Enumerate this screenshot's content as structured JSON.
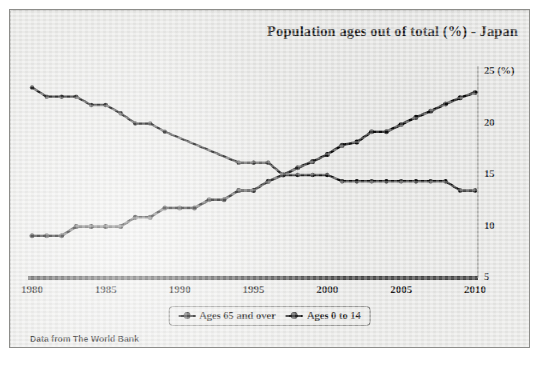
{
  "title": "Population ages out of total (%) - Japan",
  "source_note": "Data from The World Bank",
  "legend": {
    "items": [
      {
        "label": "Ages 65 and over"
      },
      {
        "label": "Ages 0 to 14"
      }
    ]
  },
  "axis": {
    "y_unit_label": "25 (%)",
    "y_ticks": [
      "25 (%)",
      "20",
      "15",
      "10",
      "5"
    ],
    "x_ticks": [
      "1980",
      "1985",
      "1990",
      "1995",
      "2000",
      "2005",
      "2010"
    ]
  },
  "colors": {
    "line": "#0d0d0d",
    "panel_background": "#e8e8e6",
    "panel_border": "#8d8d8a",
    "text": "#161616"
  },
  "chart_data": {
    "type": "line",
    "title": "Population ages out of total (%) - Japan",
    "subtitle": "",
    "xlabel": "",
    "ylabel": "(%)",
    "xlim": [
      1980,
      2010
    ],
    "ylim": [
      5,
      25
    ],
    "y_ticks": [
      5,
      10,
      15,
      20,
      25
    ],
    "x_ticks": [
      1980,
      1985,
      1990,
      1995,
      2000,
      2005,
      2010
    ],
    "grid": false,
    "legend_position": "bottom-center",
    "annotations": [
      "Data from The World Bank"
    ],
    "series": [
      {
        "name": "Ages 65 and over",
        "x": [
          1980,
          1981,
          1982,
          1983,
          1984,
          1985,
          1986,
          1987,
          1988,
          1989,
          1990,
          1991,
          1992,
          1993,
          1994,
          1995,
          1996,
          1997,
          1998,
          1999,
          2000,
          2001,
          2002,
          2003,
          2004,
          2005,
          2006,
          2007,
          2008,
          2009,
          2010
        ],
        "values": [
          9.1,
          9.1,
          9.1,
          10.0,
          10.0,
          10.0,
          10.0,
          10.9,
          10.9,
          11.8,
          11.8,
          11.8,
          12.6,
          12.6,
          13.5,
          13.5,
          14.4,
          15.0,
          15.7,
          16.3,
          17.0,
          17.9,
          18.2,
          19.2,
          19.2,
          19.9,
          20.6,
          21.2,
          21.9,
          22.5,
          23.0
        ]
      },
      {
        "name": "Ages 0 to 14",
        "x": [
          1980,
          1981,
          1982,
          1983,
          1984,
          1985,
          1986,
          1987,
          1988,
          1989,
          1994,
          1995,
          1996,
          1997,
          1998,
          1999,
          2000,
          2001,
          2002,
          2003,
          2004,
          2005,
          2006,
          2007,
          2008,
          2009,
          2010
        ],
        "values": [
          23.5,
          22.6,
          22.6,
          22.6,
          21.8,
          21.8,
          21.0,
          20.0,
          20.0,
          19.2,
          16.2,
          16.2,
          16.2,
          15.0,
          15.0,
          15.0,
          15.0,
          14.4,
          14.4,
          14.4,
          14.4,
          14.4,
          14.4,
          14.4,
          14.4,
          13.5,
          13.5
        ]
      }
    ]
  }
}
